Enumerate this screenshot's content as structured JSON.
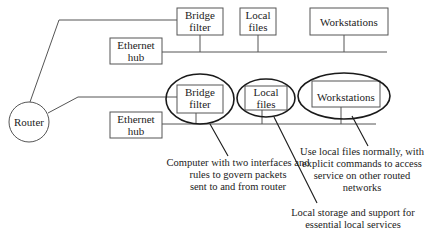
{
  "router": {
    "label": "Router"
  },
  "top_network": {
    "bridge_filter": {
      "line1": "Bridge",
      "line2": "filter"
    },
    "local_files": {
      "line1": "Local",
      "line2": "files"
    },
    "workstations": {
      "label": "Workstations"
    },
    "ethernet_hub": {
      "line1": "Ethernet",
      "line2": "hub"
    }
  },
  "bottom_network": {
    "bridge_filter": {
      "line1": "Bridge",
      "line2": "filter"
    },
    "local_files": {
      "line1": "Local",
      "line2": "files"
    },
    "workstations": {
      "label": "Workstations"
    },
    "ethernet_hub": {
      "line1": "Ethernet",
      "line2": "hub"
    }
  },
  "annotations": {
    "bridge_note": [
      "Computer with two interfaces and",
      "rules to govern packets",
      "sent to and from router"
    ],
    "local_files_note": [
      "Local storage and support for",
      "essential local services"
    ],
    "workstations_note": [
      "Use local files normally, with",
      "explicit commands to access",
      "service on other routed",
      "networks"
    ]
  },
  "colors": {
    "box_stroke": "#555555",
    "ellipse_stroke": "#1a1a1a",
    "text": "#222222",
    "background": "#ffffff"
  }
}
